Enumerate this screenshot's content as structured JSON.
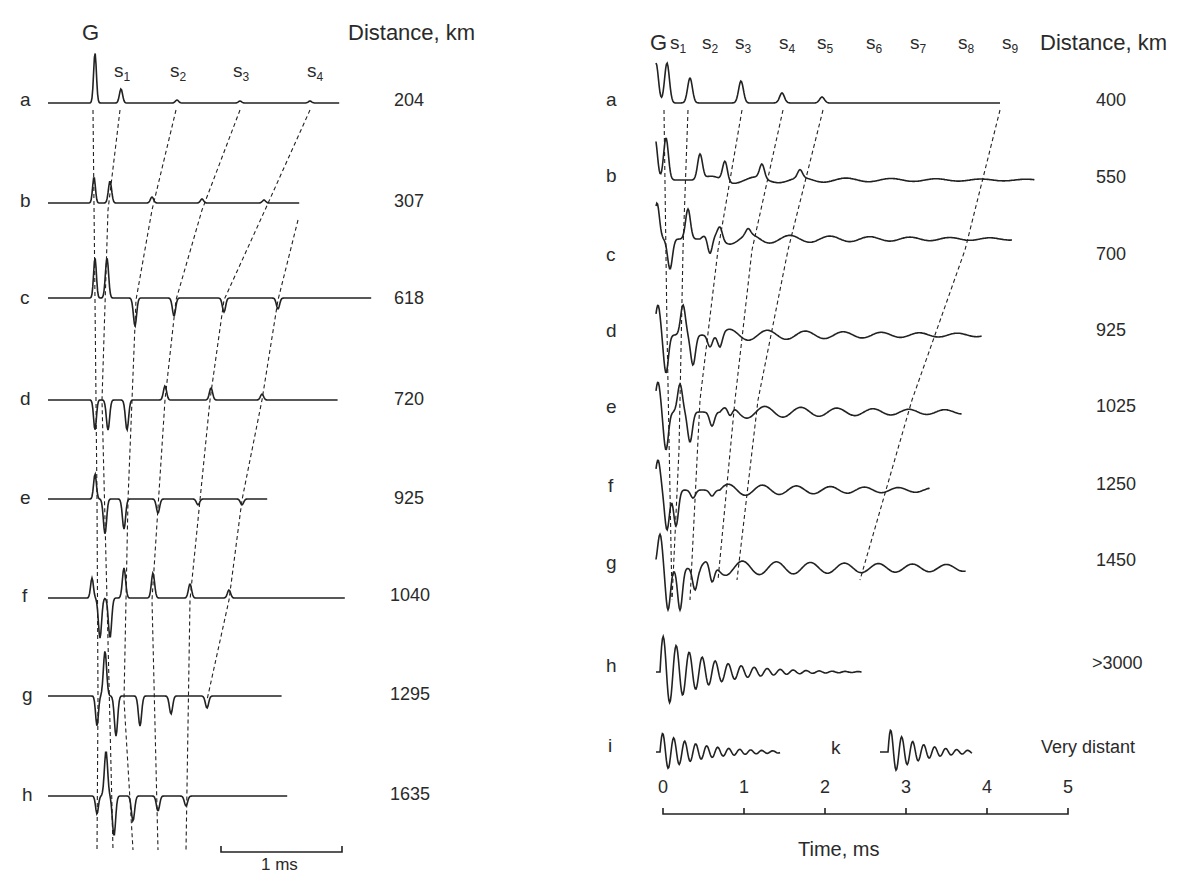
{
  "chart_data": [
    {
      "type": "line",
      "panel": "left",
      "title": "",
      "header_label": "Distance, km",
      "phase_labels": [
        "G",
        "s1",
        "s2",
        "s3",
        "s4"
      ],
      "scale_bar": "1 ms",
      "traces": [
        {
          "label": "a",
          "distance_km": "204"
        },
        {
          "label": "b",
          "distance_km": "307"
        },
        {
          "label": "c",
          "distance_km": "618"
        },
        {
          "label": "d",
          "distance_km": "720"
        },
        {
          "label": "e",
          "distance_km": "925"
        },
        {
          "label": "f",
          "distance_km": "1040"
        },
        {
          "label": "g",
          "distance_km": "1295"
        },
        {
          "label": "h",
          "distance_km": "1635"
        }
      ]
    },
    {
      "type": "line",
      "panel": "right",
      "title": "",
      "header_label": "Distance, km",
      "phase_labels": [
        "G",
        "s1",
        "s2",
        "s3",
        "s4",
        "s5",
        "s6",
        "s7",
        "s8",
        "s9"
      ],
      "xlabel": "Time, ms",
      "xticks": [
        "0",
        "1",
        "2",
        "3",
        "4",
        "5"
      ],
      "xlim": [
        0,
        5
      ],
      "traces": [
        {
          "label": "a",
          "distance_km": "400"
        },
        {
          "label": "b",
          "distance_km": "550"
        },
        {
          "label": "c",
          "distance_km": "700"
        },
        {
          "label": "d",
          "distance_km": "925"
        },
        {
          "label": "e",
          "distance_km": "1025"
        },
        {
          "label": "f",
          "distance_km": "1250"
        },
        {
          "label": "g",
          "distance_km": "1450"
        },
        {
          "label": "h",
          "distance_km": ">3000"
        },
        {
          "label": "i",
          "distance_km": "Very distant"
        },
        {
          "label": "k",
          "distance_km": "Very distant"
        }
      ]
    }
  ],
  "left": {
    "header": "Distance, km",
    "G": "G",
    "s": [
      "s",
      "s",
      "s",
      "s"
    ],
    "s_sub": [
      "1",
      "2",
      "3",
      "4"
    ],
    "rows": [
      {
        "label": "a",
        "dist": "204"
      },
      {
        "label": "b",
        "dist": "307"
      },
      {
        "label": "c",
        "dist": "618"
      },
      {
        "label": "d",
        "dist": "720"
      },
      {
        "label": "e",
        "dist": "925"
      },
      {
        "label": "f",
        "dist": "1040"
      },
      {
        "label": "g",
        "dist": "1295"
      },
      {
        "label": "h",
        "dist": "1635"
      }
    ],
    "scale": "1 ms"
  },
  "right": {
    "header": "Distance, km",
    "G": "G",
    "s": [
      "s",
      "s",
      "s",
      "s",
      "s",
      "s",
      "s",
      "s",
      "s"
    ],
    "s_sub": [
      "1",
      "2",
      "3",
      "4",
      "5",
      "6",
      "7",
      "8",
      "9"
    ],
    "rows": [
      {
        "label": "a",
        "dist": "400"
      },
      {
        "label": "b",
        "dist": "550"
      },
      {
        "label": "c",
        "dist": "700"
      },
      {
        "label": "d",
        "dist": "925"
      },
      {
        "label": "e",
        "dist": "1025"
      },
      {
        "label": "f",
        "dist": "1250"
      },
      {
        "label": "g",
        "dist": "1450"
      },
      {
        "label": "h",
        "dist": ">3000"
      },
      {
        "label": "i",
        "dist": "Very distant"
      }
    ],
    "k_label": "k",
    "ticks": [
      "0",
      "1",
      "2",
      "3",
      "4",
      "5"
    ],
    "xlabel": "Time, ms"
  }
}
